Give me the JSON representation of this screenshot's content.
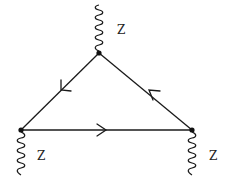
{
  "diagram": {
    "type": "feynman-triangle",
    "colors": {
      "line": "#1a1a1a",
      "background": "#ffffff"
    },
    "vertices": [
      {
        "id": "top",
        "x": 99,
        "y": 53
      },
      {
        "id": "bottom-left",
        "x": 21,
        "y": 130
      },
      {
        "id": "bottom-right",
        "x": 192,
        "y": 130
      }
    ],
    "fermion_edges": [
      {
        "from": "top",
        "to": "bottom-left",
        "arrow": "toward bottom-left"
      },
      {
        "from": "bottom-left",
        "to": "bottom-right",
        "arrow": "toward bottom-right"
      },
      {
        "from": "bottom-right",
        "to": "top",
        "arrow": "toward top"
      }
    ],
    "boson_legs": [
      {
        "vertex": "top",
        "label": "Z",
        "direction": "up"
      },
      {
        "vertex": "bottom-left",
        "label": "Z",
        "direction": "down"
      },
      {
        "vertex": "bottom-right",
        "label": "Z",
        "direction": "down"
      }
    ],
    "labels": {
      "top_z": "Z",
      "left_z": "Z",
      "right_z": "Z"
    }
  }
}
